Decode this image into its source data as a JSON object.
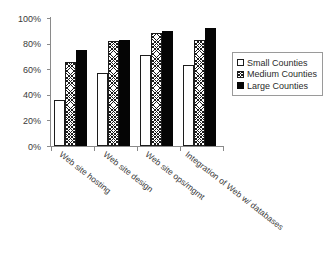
{
  "chart_data": {
    "type": "bar",
    "title": "",
    "xlabel": "",
    "ylabel": "",
    "ylim": [
      0,
      100
    ],
    "ytick_labels": [
      "100%",
      "80%",
      "60%",
      "40%",
      "20%",
      "0%"
    ],
    "ytick_values": [
      100,
      80,
      60,
      40,
      20,
      0
    ],
    "grid": false,
    "legend_position": "right",
    "categories": [
      "Web site hosting",
      "Web site design",
      "Web site ops/mgmt",
      "Integration of Web w/ databases"
    ],
    "series": [
      {
        "name": "Small Counties",
        "fill": "white",
        "color": "#ffffff",
        "values": [
          36,
          57,
          71,
          63
        ]
      },
      {
        "name": "Medium Counties",
        "fill": "crosshatch",
        "color": "#a8a8a8",
        "values": [
          66,
          82,
          88,
          83
        ]
      },
      {
        "name": "Large Counties",
        "fill": "solid",
        "color": "#050505",
        "values": [
          75,
          83,
          90,
          92
        ]
      }
    ]
  },
  "legend": {
    "items": [
      {
        "label": "Small Counties"
      },
      {
        "label": "Medium Counties"
      },
      {
        "label": "Large Counties"
      }
    ]
  }
}
